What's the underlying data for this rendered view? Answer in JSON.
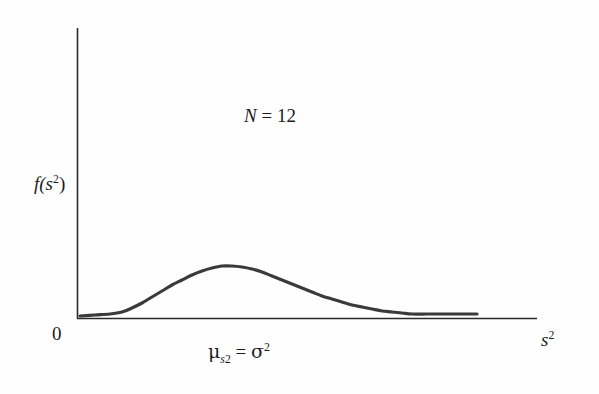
{
  "figure": {
    "background_color": "#fefefe",
    "axis_color": "#2b2b2b",
    "curve_color": "#3a3a3a"
  },
  "labels": {
    "y_axis": "f(s",
    "y_axis_sup": "2",
    "y_axis_close": ")",
    "origin": "0",
    "x_axis_var": "s",
    "x_axis_sup": "2",
    "n_label_var": "N",
    "n_label_eq": " = ",
    "n_label_value": "12",
    "mean_mu": "μ",
    "mean_mu_sub_var": "s",
    "mean_mu_sub_sup": "2",
    "mean_eq": " = ",
    "mean_sigma": "σ",
    "mean_sigma_sup": "2"
  },
  "chart_data": {
    "type": "line",
    "title": "",
    "subtitle": "",
    "xlabel": "s^2",
    "ylabel": "f(s^2)",
    "annotations": [
      {
        "text": "N = 12",
        "x_px": 244,
        "y_px": 106
      },
      {
        "text": "μ_s2 = σ2",
        "x_px": 208,
        "y_px": 342
      }
    ],
    "grid": false,
    "legend": null,
    "xlim": [
      0,
      1
    ],
    "ylim": [
      0,
      1
    ],
    "axis_pixels": {
      "origin_x": 77,
      "origin_y": 318,
      "y_axis_top": 28,
      "x_axis_right": 537
    },
    "curve_points_px": [
      [
        80,
        316
      ],
      [
        95,
        315
      ],
      [
        110,
        314
      ],
      [
        122,
        312
      ],
      [
        132,
        308
      ],
      [
        142,
        303
      ],
      [
        152,
        297
      ],
      [
        162,
        291
      ],
      [
        172,
        285
      ],
      [
        182,
        280
      ],
      [
        192,
        275
      ],
      [
        202,
        271
      ],
      [
        212,
        268
      ],
      [
        222,
        266
      ],
      [
        232,
        266
      ],
      [
        242,
        267
      ],
      [
        252,
        269
      ],
      [
        262,
        272
      ],
      [
        272,
        276
      ],
      [
        282,
        280
      ],
      [
        292,
        284
      ],
      [
        302,
        288
      ],
      [
        312,
        292
      ],
      [
        322,
        296
      ],
      [
        332,
        299
      ],
      [
        342,
        302
      ],
      [
        352,
        305
      ],
      [
        362,
        307
      ],
      [
        372,
        309
      ],
      [
        382,
        311
      ],
      [
        392,
        312
      ],
      [
        402,
        313
      ],
      [
        412,
        314
      ],
      [
        427,
        314
      ],
      [
        442,
        314
      ],
      [
        457,
        314
      ],
      [
        477,
        314
      ]
    ],
    "peak_px": [
      232,
      266
    ],
    "tail_end_px": [
      477,
      314
    ],
    "start_px": [
      80,
      316
    ]
  }
}
